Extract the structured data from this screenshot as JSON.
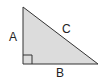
{
  "diagram": {
    "fill_color": "#dcdcdc",
    "stroke_color": "#333333",
    "labels": {
      "side_a": "A",
      "side_b": "B",
      "side_c": "C"
    },
    "right_angle_marker": true
  }
}
